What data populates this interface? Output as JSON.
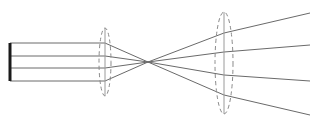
{
  "diagram": {
    "type": "optical-beam-expander",
    "colors": {
      "ray": "#6a6a6a",
      "lens": "#8a8a8a",
      "source": "#1a1a1a",
      "background": "#ffffff"
    },
    "source": {
      "x": 10,
      "y1": 43,
      "y2": 81
    },
    "lens1": {
      "cx": 105,
      "cy": 62,
      "rx": 6,
      "ry": 34
    },
    "focal_point": {
      "x": 148,
      "y": 62
    },
    "lens2": {
      "cx": 224,
      "cy": 63,
      "rx": 9,
      "ry": 51
    },
    "rays": [
      {
        "y_in": 43,
        "lens2_y": 33,
        "x_end": 310,
        "y_end": 13
      },
      {
        "y_in": 56,
        "lens2_y": 52,
        "x_end": 310,
        "y_end": 45
      },
      {
        "y_in": 68,
        "lens2_y": 75,
        "x_end": 310,
        "y_end": 81
      },
      {
        "y_in": 81,
        "lens2_y": 95,
        "x_end": 310,
        "y_end": 115
      }
    ]
  }
}
